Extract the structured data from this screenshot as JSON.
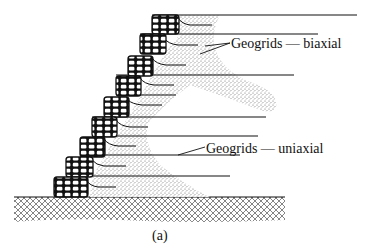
{
  "figure": {
    "subfigure_label": "(a)",
    "caption_fragment": "",
    "annotations": {
      "biaxial": "Geogrids — biaxial",
      "uniaxial": "Geogrids — uniaxial"
    },
    "colors": {
      "ink": "#111111",
      "fill_stipple": "#9a9a9a",
      "background": "#ffffff"
    }
  },
  "diagram": {
    "type": "geogrid-reinforced gabion retaining wall cross-section",
    "elements": [
      "stepped gabion facing blocks (9 tiers)",
      "long uniaxial geogrid reinforcement layers",
      "short biaxial geogrid wraps at each gabion",
      "stippled backfill zone",
      "cross-hatched foundation soil"
    ]
  }
}
